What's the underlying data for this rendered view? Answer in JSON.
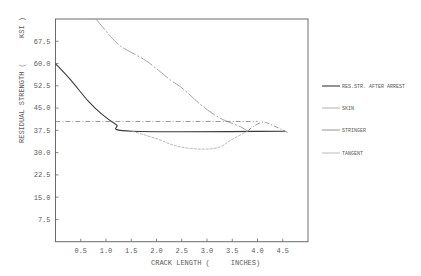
{
  "chart_data": {
    "type": "line",
    "title": "",
    "xlabel": "CRACK LENGTH (     INCHES)",
    "ylabel": "RESIDUAL STRENGTH (      KSI )",
    "xlim": [
      0,
      5.0
    ],
    "ylim": [
      0,
      75
    ],
    "grid": false,
    "legend_position": "right",
    "xticks": [
      0.5,
      1.0,
      1.5,
      2.0,
      2.5,
      3.0,
      3.5,
      4.0,
      4.5
    ],
    "xtick_labels": [
      "0.5",
      "1.0",
      "1.5",
      "2.0",
      "2.5",
      "3.0",
      "3.5",
      "4.0",
      "4.5"
    ],
    "yticks": [
      7.5,
      15.0,
      22.5,
      30.0,
      37.5,
      45.0,
      52.5,
      60.0,
      67.5
    ],
    "ytick_labels": [
      "7.5",
      "15.0",
      "22.5",
      "30.0",
      "37.5",
      "45.0",
      "52.5",
      "60.0",
      "67.5"
    ],
    "series": [
      {
        "name": "RES.STR. AFTER ARREST",
        "color": "#3a3a3a",
        "width": 1.1,
        "dash": "",
        "segments": [
          [
            [
              0,
              60.0
            ],
            [
              0.3,
              54.5
            ],
            [
              0.64,
              47.5
            ],
            [
              0.9,
              43.2
            ],
            [
              1.2,
              39.5
            ],
            [
              1.52,
              37.2
            ],
            [
              4.55,
              37.2
            ]
          ]
        ]
      },
      {
        "name": "SKIN",
        "color": "#9a9a9a",
        "width": 0.9,
        "dash": "14 2 2 2",
        "segments": [
          [
            [
              0.8,
              75.0
            ],
            [
              1.19,
              67.3
            ],
            [
              1.42,
              64.5
            ],
            [
              1.78,
              61.1
            ],
            [
              2.04,
              57.7
            ],
            [
              2.28,
              54.4
            ],
            [
              2.48,
              52.1
            ],
            [
              2.67,
              49.3
            ],
            [
              2.93,
              45.4
            ],
            [
              3.26,
              41.6
            ],
            [
              3.66,
              38.7
            ],
            [
              3.8,
              37.2
            ]
          ]
        ]
      },
      {
        "name": "STRINGER",
        "color": "#7a7a7a",
        "width": 0.8,
        "dash": "5 2 1 2",
        "segments": [
          [
            [
              0,
              40.5
            ],
            [
              4.0,
              40.5
            ]
          ],
          [
            [
              3.8,
              37.2
            ],
            [
              3.92,
              38.8
            ],
            [
              4.08,
              40.2
            ],
            [
              4.22,
              39.8
            ],
            [
              4.6,
              36.8
            ]
          ]
        ]
      },
      {
        "name": "TANGENT",
        "color": "#a8a8a8",
        "width": 0.8,
        "dash": "3 1",
        "segments": [
          [
            [
              1.52,
              37.2
            ],
            [
              1.98,
              34.8
            ],
            [
              2.38,
              32.3
            ],
            [
              2.83,
              31.2
            ],
            [
              3.22,
              31.7
            ],
            [
              3.49,
              34.4
            ],
            [
              3.8,
              37.2
            ]
          ]
        ]
      }
    ]
  }
}
